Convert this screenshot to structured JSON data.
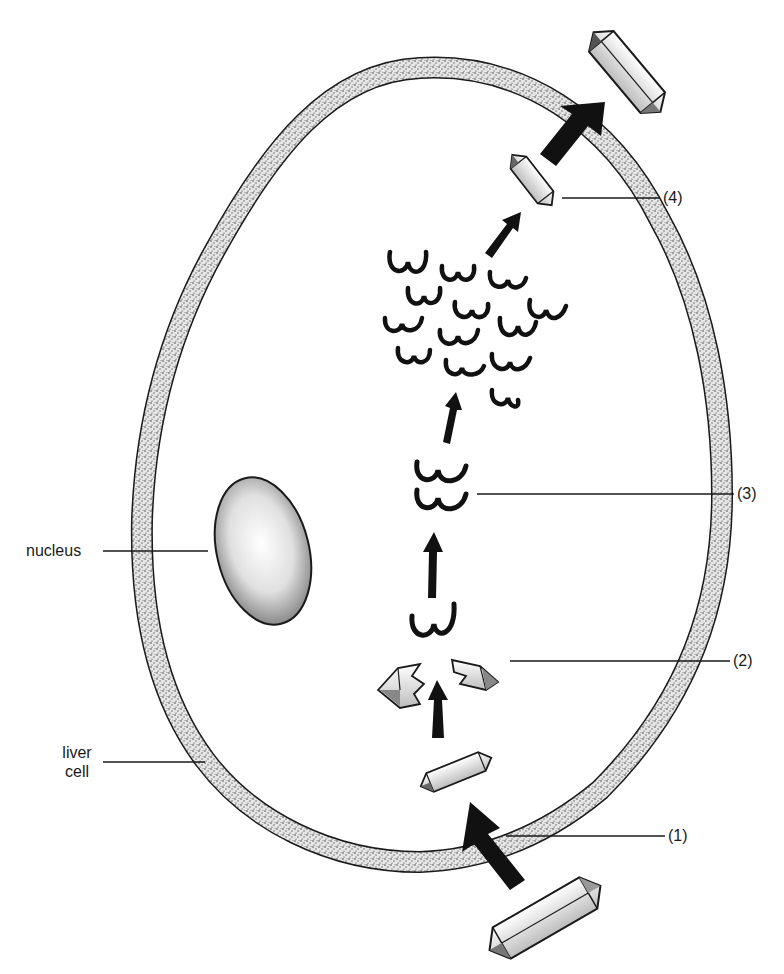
{
  "diagram": {
    "type": "biology-process-diagram",
    "colors": {
      "ink": "#1a1a1a",
      "background": "#ffffff",
      "stipple": "#555555"
    },
    "labels": {
      "nucleus": "nucleus",
      "liver_cell_line1": "liver",
      "liver_cell_line2": "cell",
      "step1": "(1)",
      "step2": "(2)",
      "step3": "(3)",
      "step4": "(4)"
    },
    "stages": [
      {
        "id": "step1",
        "label": "(1)",
        "depicts": "large crystal entering through cell membrane (large arrow)"
      },
      {
        "id": "step2",
        "label": "(2)",
        "depicts": "crystal broken into two halves releasing a chain"
      },
      {
        "id": "step3",
        "label": "(3)",
        "depicts": "pair of wavy chain molecules"
      },
      {
        "id": "multiply",
        "label": "",
        "depicts": "many wavy chain molecules"
      },
      {
        "id": "step4",
        "label": "(4)",
        "depicts": "small crystal reformed, then exported through membrane (large arrow)"
      }
    ]
  }
}
